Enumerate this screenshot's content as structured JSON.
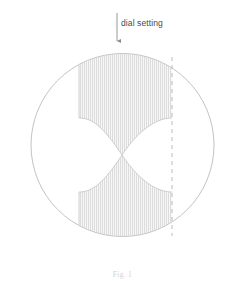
{
  "figure": {
    "name": "dial-setting-bowtie-diagram",
    "caption": "Fig. 1",
    "background_color": "#ffffff",
    "annotations": [
      {
        "id": "dial-setting",
        "label": "dial setting",
        "pointer": "down-arrow",
        "text_color": "#4a4a4a"
      }
    ],
    "circle": {
      "name": "outer-circle",
      "center_x": 122.5,
      "center_y": 145,
      "radius": 91.5,
      "stroke_color": "#b9b9b9",
      "stroke_width": 0.8,
      "fill": "none"
    },
    "shaded_region": {
      "name": "bowtie-hatched-region",
      "description": "Two concave-sided lobes meeting at a pinch point at the circle centre, clipped by the circle, filled with fine vertical hatch lines.",
      "pinch_x": 122,
      "pinch_y": 155,
      "left_boundary_x": 79,
      "right_boundary_x": 172,
      "hatch": {
        "orientation": "vertical",
        "spacing_px": 2,
        "line_color": "#c4c4c4",
        "line_width": 0.55
      },
      "fill_color": "#f4f4f4"
    },
    "dashed_line": {
      "name": "right-dial-dashed-line",
      "x": 172,
      "stroke_color": "#a8a8a8",
      "stroke_width": 0.8,
      "dash_pattern": "4 4"
    },
    "arrow": {
      "name": "dial-setting-arrow",
      "x": 117,
      "y_top": 13,
      "y_bottom": 45,
      "stroke_color": "#8c8c8c",
      "stroke_width": 0.9,
      "head": "solid-triangle"
    }
  }
}
